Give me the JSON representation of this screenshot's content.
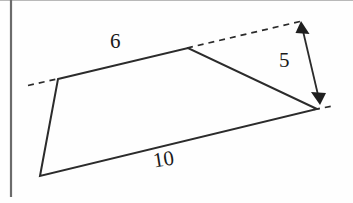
{
  "figure": {
    "type": "geometry-diagram",
    "canvas": {
      "width": 353,
      "height": 203,
      "background": "#fefefe"
    },
    "colors": {
      "stroke": "#2b2b2b",
      "dashed_stroke": "#2b2b2b",
      "text": "#1a1a1a",
      "page_edge": "#6b6b6b"
    },
    "labels": {
      "top_side": "6",
      "bottom_side": "10",
      "height": "5"
    },
    "vertices": {
      "top_left": {
        "x": 58,
        "y": 79
      },
      "top_right": {
        "x": 188,
        "y": 48
      },
      "right": {
        "x": 317,
        "y": 109
      },
      "bottom_left": {
        "x": 40,
        "y": 176
      }
    },
    "dashed_extensions": {
      "left": {
        "x1": 28,
        "y1": 85,
        "x2": 58,
        "y2": 79
      },
      "top_right": {
        "x1": 188,
        "y1": 48,
        "x2": 299,
        "y2": 22
      },
      "bottom_right": {
        "x1": 317,
        "y1": 109,
        "x2": 332,
        "y2": 106
      }
    },
    "dimension_arrow": {
      "label": "5",
      "from": {
        "x": 301,
        "y": 24
      },
      "to": {
        "x": 320,
        "y": 104
      },
      "double_headed": true
    },
    "page_edge_line": {
      "x": 11,
      "y1": 0,
      "y2": 197
    }
  }
}
